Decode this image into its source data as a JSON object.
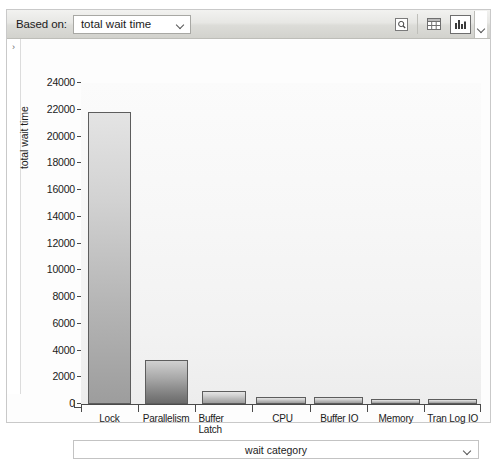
{
  "toolbar": {
    "based_on_label": "Based on:",
    "basis_value": "total wait time",
    "buttons": [
      {
        "name": "magnifier-icon",
        "title": "zoom"
      },
      {
        "name": "grid-view-icon",
        "title": "grid"
      },
      {
        "name": "bar-chart-icon",
        "title": "chart",
        "selected": true
      }
    ]
  },
  "panel": {
    "expander_glyph": "›"
  },
  "chart_data": {
    "type": "bar",
    "title": "",
    "xlabel": "wait category",
    "ylabel": "total wait time",
    "categories": [
      "Lock",
      "Parallelism",
      "Buffer Latch",
      "CPU",
      "Buffer IO",
      "Memory",
      "Tran Log IO"
    ],
    "category_lines": [
      [
        "Lock"
      ],
      [
        "Parallelism"
      ],
      [
        "Buffer",
        "Latch"
      ],
      [
        "CPU"
      ],
      [
        "Buffer IO"
      ],
      [
        "Memory"
      ],
      [
        "Tran Log IO"
      ]
    ],
    "values": [
      21800,
      3300,
      1000,
      500,
      500,
      400,
      200
    ],
    "ylim": [
      0,
      24000
    ],
    "yticks": [
      0,
      2000,
      4000,
      6000,
      8000,
      10000,
      12000,
      14000,
      16000,
      18000,
      20000,
      22000,
      24000
    ],
    "ytick_labels": [
      "0",
      "2000",
      "4000",
      "6000",
      "8000",
      "10000",
      "12000",
      "14000",
      "16000",
      "18000",
      "20000",
      "22000",
      "24000"
    ],
    "grid": false,
    "legend": "none",
    "series": [
      {
        "name": "total wait time",
        "values": [
          21800,
          3300,
          1000,
          500,
          500,
          400,
          200
        ]
      }
    ]
  },
  "colors": {
    "bar_top": "#e4e4e4",
    "bar_bottom": "#9d9d9d",
    "bar_border": "#5d5d5d",
    "toolbar_top": "#f2f2f0",
    "toolbar_bottom": "#d2d2cd",
    "plot_bg": "#f7f7f7",
    "axis": "#4a4a4a",
    "text": "#1b1b1b"
  }
}
